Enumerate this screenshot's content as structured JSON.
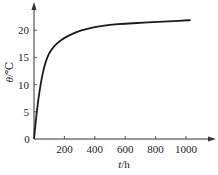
{
  "chart_data": {
    "type": "line",
    "title": "",
    "xlabel": "t/h",
    "ylabel": "θ/℃",
    "xlim": [
      0,
      1150
    ],
    "ylim": [
      0,
      24
    ],
    "x_ticks": [
      200,
      400,
      600,
      800,
      1000
    ],
    "y_ticks": [
      0,
      5,
      10,
      15,
      20
    ],
    "grid": false,
    "legend": null,
    "series": [
      {
        "name": "θ",
        "x": [
          0,
          20,
          40,
          60,
          80,
          100,
          130,
          160,
          200,
          250,
          300,
          400,
          500,
          600,
          700,
          800,
          900,
          1000,
          1030
        ],
        "y": [
          0,
          5.5,
          9.5,
          12.5,
          14.5,
          15.8,
          17.0,
          17.8,
          18.6,
          19.3,
          19.9,
          20.6,
          21.0,
          21.2,
          21.35,
          21.5,
          21.65,
          21.8,
          21.85
        ]
      }
    ]
  },
  "axes": {
    "origin_label": "0",
    "x_label_italic": "t",
    "x_label_unit": "/h",
    "y_label_italic": "θ",
    "y_label_unit": "/℃",
    "x_tick_labels": [
      "200",
      "400",
      "600",
      "800",
      "1000"
    ],
    "y_tick_labels": [
      "5",
      "10",
      "15",
      "20"
    ]
  },
  "colors": {
    "line": "#1a1a1a",
    "axis": "#333333",
    "text": "#222222"
  }
}
